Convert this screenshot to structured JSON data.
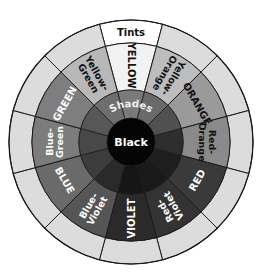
{
  "wheel": {
    "title": "Color wheel: tints, hues, shades",
    "center_label": "Black",
    "tints_label": "Tints",
    "shades_label": "Shades",
    "center": [
      131,
      142
    ],
    "radii": {
      "outer": 122,
      "tint_inner": 99,
      "hue_inner": 52,
      "black": 24
    },
    "colors": {
      "tint": "#dcdcdc",
      "tint_top": "#ffffff",
      "border": "#1a1a1a",
      "black": "#050505"
    },
    "segments": [
      {
        "name": "yellow",
        "lines": [
          "YELLOW"
        ],
        "hue_fill": "#f2f2f2",
        "shade_fill": "#7a7a7a",
        "text_color": "#111111",
        "radial": true
      },
      {
        "name": "yellow-orange",
        "lines": [
          "Yellow-",
          "Orange"
        ],
        "hue_fill": "#bdbdbd",
        "shade_fill": "#6a6a6a",
        "text_color": "#111111",
        "radial": true
      },
      {
        "name": "orange",
        "lines": [
          "ORANGE"
        ],
        "hue_fill": "#9a9a9a",
        "shade_fill": "#505050",
        "text_color": "#111111",
        "radial": false
      },
      {
        "name": "red-orange",
        "lines": [
          "Red-",
          "Orange"
        ],
        "hue_fill": "#8a8a8a",
        "shade_fill": "#2e2e2e",
        "text_color": "#111111",
        "radial": false
      },
      {
        "name": "red",
        "lines": [
          "RED"
        ],
        "hue_fill": "#3a3a3a",
        "shade_fill": "#1e1e1e",
        "text_color": "#ffffff",
        "radial": false
      },
      {
        "name": "red-violet",
        "lines": [
          "Red-",
          "Violet"
        ],
        "hue_fill": "#333333",
        "shade_fill": "#1a1a1a",
        "text_color": "#ffffff",
        "radial": true
      },
      {
        "name": "violet",
        "lines": [
          "VIOLET"
        ],
        "hue_fill": "#2a2a2a",
        "shade_fill": "#161616",
        "text_color": "#ffffff",
        "radial": true
      },
      {
        "name": "blue-violet",
        "lines": [
          "Blue-",
          "Violet"
        ],
        "hue_fill": "#555555",
        "shade_fill": "#2a2a2a",
        "text_color": "#ffffff",
        "radial": true
      },
      {
        "name": "blue",
        "lines": [
          "BLUE"
        ],
        "hue_fill": "#6a6a6a",
        "shade_fill": "#3c3c3c",
        "text_color": "#ffffff",
        "radial": false
      },
      {
        "name": "blue-green",
        "lines": [
          "Blue-",
          "Green"
        ],
        "hue_fill": "#7c7c7c",
        "shade_fill": "#484848",
        "text_color": "#ffffff",
        "radial": false
      },
      {
        "name": "green",
        "lines": [
          "GREEN"
        ],
        "hue_fill": "#7e7e7e",
        "shade_fill": "#575757",
        "text_color": "#ffffff",
        "radial": false
      },
      {
        "name": "yellow-green",
        "lines": [
          "Yellow-",
          "Green"
        ],
        "hue_fill": "#b8b8b8",
        "shade_fill": "#6e6e6e",
        "text_color": "#111111",
        "radial": true
      }
    ]
  }
}
